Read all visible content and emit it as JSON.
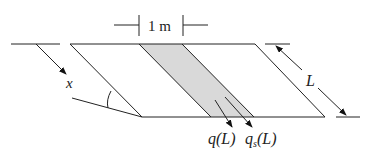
{
  "diagram": {
    "type": "slope-strip schematic",
    "width_label": "1 m",
    "x_label": "x",
    "length_label": "L",
    "flux_label_1": "q(L)",
    "flux_label_2_main": "q",
    "flux_label_2_sub": "s",
    "flux_label_2_arg": "(L)",
    "colors": {
      "line": "#222222",
      "shaded_strip": "#d9d9d9"
    }
  }
}
